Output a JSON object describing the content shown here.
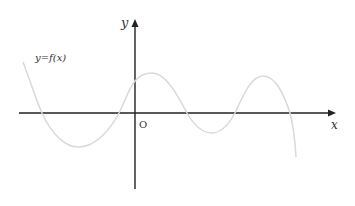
{
  "diagram": {
    "function_label": "y=f(x)",
    "origin_label": "O",
    "x_axis_label": "x",
    "y_axis_label": "y",
    "colors": {
      "axis": "#222222",
      "curve": "#d9d9d9",
      "text": "#333333",
      "background": "#ffffff"
    },
    "axes": {
      "x_axis": {
        "x1": 19,
        "y": 113,
        "x2": 335
      },
      "y_axis": {
        "x": 135,
        "y1": 189,
        "y2": 20
      }
    },
    "curve_points": [
      [
        23,
        62
      ],
      [
        42,
        113
      ],
      [
        80,
        147
      ],
      [
        119,
        113
      ],
      [
        135,
        81
      ],
      [
        152,
        73
      ],
      [
        187,
        113
      ],
      [
        212,
        133
      ],
      [
        235,
        113
      ],
      [
        263,
        76
      ],
      [
        290,
        113
      ],
      [
        296,
        157
      ]
    ],
    "zero_crossings_px": [
      42,
      119,
      187,
      235,
      290
    ],
    "y_intercept_px": [
      135,
      81
    ]
  }
}
